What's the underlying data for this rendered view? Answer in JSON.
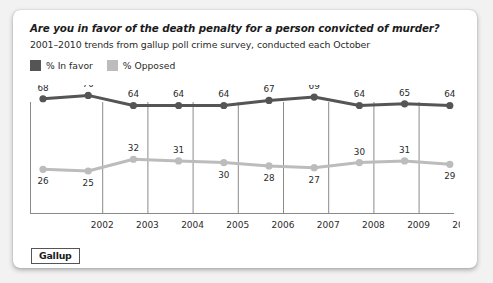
{
  "card": {
    "title": "Are you in favor of the death penalty for a person convicted of murder?",
    "subtitle": "2001–2010 trends from gallup poll crime survey, conducted each October",
    "logo": "Gallup"
  },
  "legend": {
    "items": [
      {
        "label": "% In favor",
        "color": "#555555",
        "swatch_name": "legend-swatch-in-favor"
      },
      {
        "label": "% Opposed",
        "color": "#bcbcbc",
        "swatch_name": "legend-swatch-opposed"
      }
    ]
  },
  "colors": {
    "in_favor": "#555555",
    "opposed": "#bcbcbc",
    "gridline": "#8a8a8a",
    "axis": "#8a8a8a",
    "text": "#2b2b2b",
    "card_background": "#ffffff",
    "page_background": "#f2f2f2"
  },
  "chart_data": {
    "type": "line",
    "title": "Are you in favor of the death penalty for a person convicted of murder?",
    "subtitle": "2001–2010 trends from gallup poll crime survey, conducted each October",
    "xlabel": "",
    "ylabel": "",
    "x": [
      2001,
      2002,
      2003,
      2004,
      2005,
      2006,
      2007,
      2008,
      2009,
      2010
    ],
    "tick_labels": [
      "2002",
      "2003",
      "2004",
      "2005",
      "2006",
      "2007",
      "2008",
      "2009",
      "2010"
    ],
    "ylim": [
      0,
      100
    ],
    "grid": "vertical",
    "legend_position": "top-left",
    "series": [
      {
        "name": "% In favor",
        "color": "#555555",
        "values": [
          68,
          70,
          64,
          64,
          64,
          67,
          69,
          64,
          65,
          64
        ],
        "label_positions": [
          "above",
          "above",
          "above",
          "above",
          "above",
          "above",
          "above",
          "above",
          "above",
          "above"
        ]
      },
      {
        "name": "% Opposed",
        "color": "#bcbcbc",
        "values": [
          26,
          25,
          32,
          31,
          30,
          28,
          27,
          30,
          31,
          29
        ],
        "label_positions": [
          "below",
          "below",
          "above",
          "above",
          "below",
          "below",
          "below",
          "above",
          "above",
          "below"
        ]
      }
    ]
  }
}
